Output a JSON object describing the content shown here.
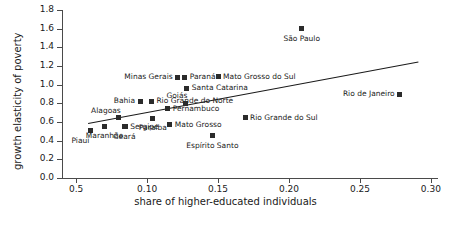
{
  "chart_data": {
    "type": "scatter",
    "title": "",
    "xlabel": "share of higher-educated individuals",
    "ylabel": "growth elasticity of poverty",
    "xlim": [
      0.04,
      0.305
    ],
    "ylim": [
      0.0,
      1.8
    ],
    "grid": false,
    "legend": "none",
    "x_ticks": [
      {
        "value": 0.05,
        "label": "0.5"
      },
      {
        "value": 0.1,
        "label": "0.10"
      },
      {
        "value": 0.15,
        "label": "0.15"
      },
      {
        "value": 0.2,
        "label": "0.20"
      },
      {
        "value": 0.25,
        "label": "0.25"
      },
      {
        "value": 0.3,
        "label": "0.30"
      }
    ],
    "y_ticks": [
      {
        "value": 0.0,
        "label": "0.0"
      },
      {
        "value": 0.2,
        "label": "0.2"
      },
      {
        "value": 0.4,
        "label": "0.4"
      },
      {
        "value": 0.6,
        "label": "0.6"
      },
      {
        "value": 0.8,
        "label": "0.8"
      },
      {
        "value": 1.0,
        "label": "1.0"
      },
      {
        "value": 1.2,
        "label": "1.2"
      },
      {
        "value": 1.4,
        "label": "1.4"
      },
      {
        "value": 1.6,
        "label": "1.6"
      },
      {
        "value": 1.8,
        "label": "1.8"
      }
    ],
    "points": [
      {
        "name": "Piauí",
        "x": 0.06,
        "y": 0.505,
        "label_pos": "below-left"
      },
      {
        "name": "Maranhão",
        "x": 0.07,
        "y": 0.555,
        "label_pos": "below"
      },
      {
        "name": "Alagoas",
        "x": 0.08,
        "y": 0.645,
        "label_pos": "above-left"
      },
      {
        "name": "Ceará",
        "x": 0.084,
        "y": 0.55,
        "label_pos": "below"
      },
      {
        "name": "Sergipe",
        "x": 0.0845,
        "y": 0.55,
        "label_pos": "right"
      },
      {
        "name": "Bahia",
        "x": 0.095,
        "y": 0.82,
        "label_pos": "left"
      },
      {
        "name": "Rio Grande do Norte",
        "x": 0.103,
        "y": 0.82,
        "label_pos": "right"
      },
      {
        "name": "Paraíba",
        "x": 0.104,
        "y": 0.64,
        "label_pos": "below"
      },
      {
        "name": "Pernambuco",
        "x": 0.1145,
        "y": 0.74,
        "label_pos": "right"
      },
      {
        "name": "Mato Grosso",
        "x": 0.116,
        "y": 0.57,
        "label_pos": "right"
      },
      {
        "name": "Minas Gerais",
        "x": 0.1215,
        "y": 1.08,
        "label_pos": "left"
      },
      {
        "name": "Paraná",
        "x": 0.1265,
        "y": 1.08,
        "label_pos": "right"
      },
      {
        "name": "Goiás",
        "x": 0.127,
        "y": 0.8,
        "label_pos": "above-left"
      },
      {
        "name": "Santa Catarina",
        "x": 0.128,
        "y": 0.96,
        "label_pos": "right"
      },
      {
        "name": "Espírito Santo",
        "x": 0.146,
        "y": 0.455,
        "label_pos": "below"
      },
      {
        "name": "Mato Grosso do Sul",
        "x": 0.15,
        "y": 1.085,
        "label_pos": "right"
      },
      {
        "name": "Rio Grande do Sul",
        "x": 0.169,
        "y": 0.645,
        "label_pos": "right"
      },
      {
        "name": "São Paulo",
        "x": 0.209,
        "y": 1.6,
        "label_pos": "below"
      },
      {
        "name": "Rio de Janeiro",
        "x": 0.278,
        "y": 0.9,
        "label_pos": "left"
      }
    ],
    "trend_line": {
      "x1": 0.058,
      "y1": 0.59,
      "x2": 0.291,
      "y2": 1.25
    }
  }
}
